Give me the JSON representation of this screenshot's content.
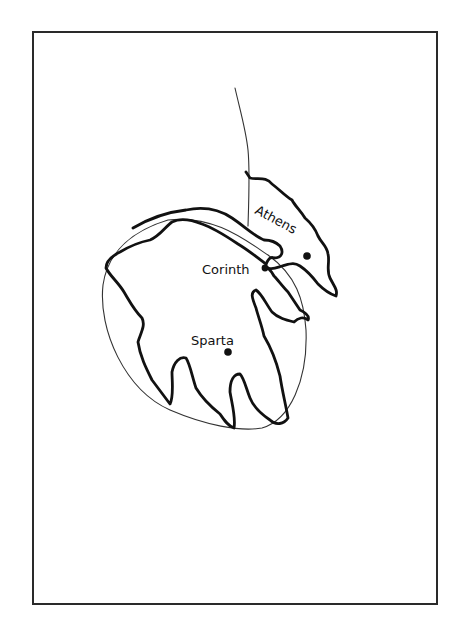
{
  "map": {
    "type": "hand-drawn sketch map",
    "region": "Peloponnese and Attica",
    "cities": [
      {
        "name": "Athens",
        "label": "Athens",
        "dot": [
          307,
          256
        ],
        "label_pos": [
          254,
          213
        ],
        "label_rotation": 28
      },
      {
        "name": "Corinth",
        "label": "Corinth",
        "dot": [
          265,
          268
        ],
        "label_pos": [
          202,
          274
        ],
        "label_rotation": 0
      },
      {
        "name": "Sparta",
        "label": "Sparta",
        "dot": [
          228,
          352
        ],
        "label_pos": [
          191,
          345
        ],
        "label_rotation": 0
      }
    ],
    "colors": {
      "ink": "#111111",
      "background": "#ffffff",
      "frame": "#2a2a2a"
    }
  }
}
